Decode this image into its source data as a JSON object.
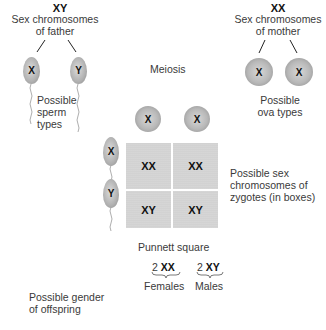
{
  "father": {
    "genotype": "XY",
    "label_line1": "Sex chromosomes",
    "label_line2": "of father",
    "sperm": [
      "X",
      "Y"
    ],
    "sperm_label_line1": "Possible",
    "sperm_label_line2": "sperm",
    "sperm_label_line3": "types"
  },
  "mother": {
    "genotype": "XX",
    "label_line1": "Sex chromosomes",
    "label_line2": "of mother",
    "ova": [
      "X",
      "X"
    ],
    "ova_label_line1": "Possible",
    "ova_label_line2": "ova types"
  },
  "meiosis_label": "Meiosis",
  "punnett": {
    "column_headers": [
      "X",
      "X"
    ],
    "row_headers": [
      "X",
      "Y"
    ],
    "cells": [
      [
        "XX",
        "XX"
      ],
      [
        "XY",
        "XY"
      ]
    ],
    "caption": "Punnett square",
    "side_label_line1": "Possible sex",
    "side_label_line2": "chromosomes of",
    "side_label_line3": "zygotes (in boxes)"
  },
  "offspring": {
    "label_line1": "Possible gender",
    "label_line2": "of offspring",
    "groups": [
      {
        "count": "2",
        "genotype": "XX",
        "gender": "Females"
      },
      {
        "count": "2",
        "genotype": "XY",
        "gender": "Males"
      }
    ]
  },
  "colors": {
    "cell_fill": "#d2d2d2",
    "gamete_fill": "#b8b8b8",
    "text": "#3a3a3a"
  }
}
